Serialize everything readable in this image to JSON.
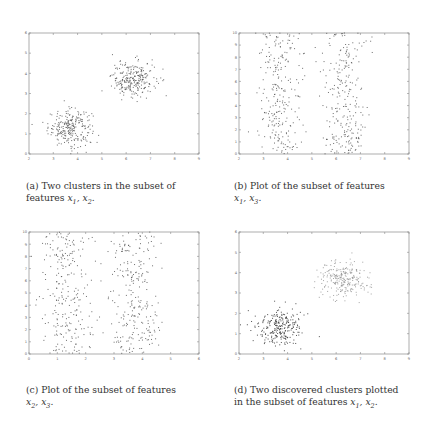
{
  "chart_data": [
    {
      "id": "a",
      "type": "scatter",
      "title": "",
      "caption_prefix": "(a) Two clusters in the subset of",
      "caption_suffix": "features",
      "caption_math": "x1, x2.",
      "xlabel": "",
      "ylabel": "",
      "xlim": [
        2,
        9
      ],
      "ylim": [
        0,
        6
      ],
      "xticks": [
        2,
        3,
        4,
        5,
        6,
        7,
        8,
        9
      ],
      "yticks": [
        0,
        1,
        2,
        3,
        4,
        5,
        6
      ],
      "grid": false,
      "legend": "none",
      "series": [
        {
          "name": "cluster-1",
          "points_description": "approx. 250 points",
          "center": [
            3.7,
            1.3
          ],
          "spread": [
            0.45,
            0.45
          ],
          "count": 250
        },
        {
          "name": "cluster-2",
          "points_description": "approx. 250 points",
          "center": [
            6.3,
            3.7
          ],
          "spread": [
            0.45,
            0.45
          ],
          "count": 250
        }
      ],
      "marker_color": "#555555"
    },
    {
      "id": "b",
      "type": "scatter",
      "title": "",
      "caption_prefix": "(b) Plot of the subset of features",
      "caption_suffix": "",
      "caption_math": "x1, x3.",
      "xlabel": "",
      "ylabel": "",
      "xlim": [
        2,
        9
      ],
      "ylim": [
        0,
        10
      ],
      "xticks": [
        2,
        3,
        4,
        5,
        6,
        7,
        8,
        9
      ],
      "yticks": [
        0,
        1,
        2,
        3,
        4,
        5,
        6,
        7,
        8,
        9,
        10
      ],
      "grid": false,
      "legend": "none",
      "series": [
        {
          "name": "cluster-1",
          "center_x": 3.7,
          "spread_x": 0.45,
          "y_uniform": [
            0,
            10
          ],
          "count": 250
        },
        {
          "name": "cluster-2",
          "center_x": 6.3,
          "spread_x": 0.45,
          "y_uniform": [
            0,
            10
          ],
          "count": 250
        }
      ],
      "marker_color": "#555555"
    },
    {
      "id": "c",
      "type": "scatter",
      "title": "",
      "caption_prefix": "(c) Plot of the subset of features",
      "caption_suffix": "",
      "caption_math": "x2, x3.",
      "xlabel": "",
      "ylabel": "",
      "xlim": [
        0,
        6
      ],
      "ylim": [
        0,
        10
      ],
      "xticks": [
        0,
        1,
        2,
        3,
        4,
        5,
        6
      ],
      "yticks": [
        0,
        1,
        2,
        3,
        4,
        5,
        6,
        7,
        8,
        9,
        10
      ],
      "grid": false,
      "legend": "none",
      "series": [
        {
          "name": "cluster-1",
          "center_x": 1.3,
          "spread_x": 0.45,
          "y_uniform": [
            0,
            10
          ],
          "count": 250
        },
        {
          "name": "cluster-2",
          "center_x": 3.7,
          "spread_x": 0.45,
          "y_uniform": [
            0,
            10
          ],
          "count": 250
        }
      ],
      "marker_color": "#555555"
    },
    {
      "id": "d",
      "type": "scatter",
      "title": "",
      "caption_prefix": "(d) Two discovered clusters plotted",
      "caption_suffix": "in the subset of features",
      "caption_math": "x1, x2.",
      "xlabel": "",
      "ylabel": "",
      "xlim": [
        2,
        9
      ],
      "ylim": [
        0,
        6
      ],
      "xticks": [
        2,
        3,
        4,
        5,
        6,
        7,
        8,
        9
      ],
      "yticks": [
        0,
        1,
        2,
        3,
        4,
        5,
        6
      ],
      "grid": false,
      "legend": "none",
      "series": [
        {
          "name": "discovered-cluster-1",
          "marker": "dark",
          "center": [
            3.7,
            1.3
          ],
          "spread": [
            0.45,
            0.45
          ],
          "count": 250,
          "color": "#333333"
        },
        {
          "name": "discovered-cluster-2",
          "marker": "light",
          "center": [
            6.3,
            3.7
          ],
          "spread": [
            0.45,
            0.45
          ],
          "count": 250,
          "color": "#888888"
        }
      ]
    }
  ]
}
